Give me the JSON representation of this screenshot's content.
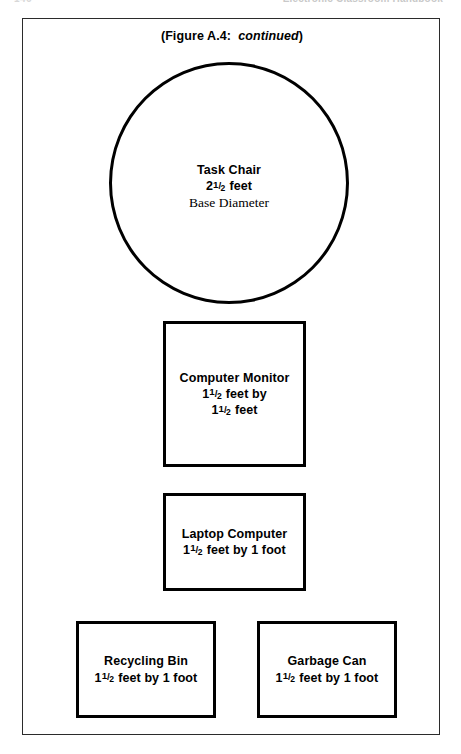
{
  "header": {
    "page_number": "146",
    "book_title": "Electronic Classroom Handbook"
  },
  "figure": {
    "caption_prefix": "(Figure A.4:",
    "caption_status": "continued",
    "caption_suffix": ")"
  },
  "shapes": [
    {
      "id": "task-chair",
      "shape": "circle",
      "name": "Task Chair",
      "dimension_whole": "2",
      "dimension_frac_num": "1",
      "dimension_frac_den": "2",
      "dimension_unit": "feet",
      "dimension_text": "2 1/2 feet",
      "subtitle": "Base Diameter"
    },
    {
      "id": "computer-monitor",
      "shape": "square",
      "name": "Computer Monitor",
      "dimension_line1_whole": "1",
      "dimension_line1_frac_num": "1",
      "dimension_line1_frac_den": "2",
      "dimension_line1_unit": "feet by",
      "dimension_line2_whole": "1",
      "dimension_line2_frac_num": "1",
      "dimension_line2_frac_den": "2",
      "dimension_line2_unit": "feet",
      "dimension_text": "1 1/2 feet by 1 1/2 feet"
    },
    {
      "id": "laptop-computer",
      "shape": "rectangle",
      "name": "Laptop Computer",
      "dimension_whole": "1",
      "dimension_frac_num": "1",
      "dimension_frac_den": "2",
      "dimension_unit": "feet by 1 foot",
      "dimension_text": "1 1/2 feet by 1 foot"
    },
    {
      "id": "recycling-bin",
      "shape": "rectangle",
      "name": "Recycling Bin",
      "dimension_whole": "1",
      "dimension_frac_num": "1",
      "dimension_frac_den": "2",
      "dimension_unit": "feet by 1 foot",
      "dimension_text": "1 1/2 feet by 1 foot"
    },
    {
      "id": "garbage-can",
      "shape": "rectangle",
      "name": "Garbage Can",
      "dimension_whole": "1",
      "dimension_frac_num": "1",
      "dimension_frac_den": "2",
      "dimension_unit": "feet by 1 foot",
      "dimension_text": "1 1/2 feet by 1 foot"
    }
  ],
  "colors": {
    "ink": "#000000",
    "frame": "#2b2b2b",
    "paper": "#ffffff",
    "header_faded": "#c9c9c9"
  }
}
